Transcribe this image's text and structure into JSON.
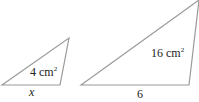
{
  "diagram": {
    "small_triangle": {
      "area_value": "4",
      "area_unit": "cm",
      "area_exponent": "2",
      "base_label": "x"
    },
    "large_triangle": {
      "area_value": "16",
      "area_unit": "cm",
      "area_exponent": "2",
      "base_label": "6"
    },
    "stroke_color": "#9a9a9a",
    "text_color": "#222222"
  }
}
